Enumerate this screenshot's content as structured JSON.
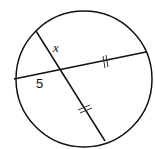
{
  "diagram": {
    "type": "circle with two intersecting chords",
    "labels": {
      "x": "x",
      "five": "5"
    },
    "circle": {
      "cx": 84,
      "cy": 79,
      "r": 69
    },
    "chord_a": {
      "x1": 14,
      "y1": 79,
      "x2": 146,
      "y2": 52,
      "tick": "double"
    },
    "chord_b": {
      "x1": 36,
      "y1": 31,
      "x2": 105,
      "y2": 141,
      "tick": "double"
    },
    "stroke": "#111111"
  }
}
